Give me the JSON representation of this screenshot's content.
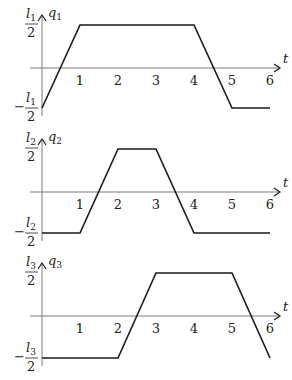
{
  "figure": {
    "t_axis_label": "t",
    "tick_labels": [
      "1",
      "2",
      "3",
      "4",
      "5",
      "6"
    ],
    "colors": {
      "curve": "#1a1a1a",
      "axis": "#7a7a7a",
      "text": "#222222"
    }
  },
  "plots": [
    {
      "id": "q1",
      "y_label": "q",
      "y_label_sub": "1",
      "top_label": "l",
      "top_label_sub": "1",
      "bottom_label": "l",
      "bottom_label_sub": "1",
      "denominator": "2",
      "minus": "−"
    },
    {
      "id": "q2",
      "y_label": "q",
      "y_label_sub": "2",
      "top_label": "l",
      "top_label_sub": "2",
      "bottom_label": "l",
      "bottom_label_sub": "2",
      "denominator": "2",
      "minus": "−"
    },
    {
      "id": "q3",
      "y_label": "q",
      "y_label_sub": "3",
      "top_label": "l",
      "top_label_sub": "3",
      "bottom_label": "l",
      "bottom_label_sub": "3",
      "denominator": "2",
      "minus": "−"
    }
  ],
  "chart_data": [
    {
      "type": "line",
      "title": "q1(t)",
      "xlabel": "t",
      "ylabel": "q1",
      "x": [
        0,
        1,
        4,
        5,
        6
      ],
      "y": [
        "-l1/2",
        "l1/2",
        "l1/2",
        "-l1/2",
        "-l1/2"
      ],
      "y_numeric": [
        -0.5,
        0.5,
        0.5,
        -0.5,
        -0.5
      ],
      "xlim": [
        0,
        6
      ],
      "ylim": [
        -0.5,
        0.5
      ],
      "x_ticks": [
        1,
        2,
        3,
        4,
        5,
        6
      ],
      "y_ticks": [
        "-l1/2",
        "l1/2"
      ],
      "grid": false
    },
    {
      "type": "line",
      "title": "q2(t)",
      "xlabel": "t",
      "ylabel": "q2",
      "x": [
        0,
        1,
        2,
        3,
        4,
        6
      ],
      "y": [
        "-l2/2",
        "-l2/2",
        "l2/2",
        "l2/2",
        "-l2/2",
        "-l2/2"
      ],
      "y_numeric": [
        -0.5,
        -0.5,
        0.5,
        0.5,
        -0.5,
        -0.5
      ],
      "xlim": [
        0,
        6
      ],
      "ylim": [
        -0.5,
        0.5
      ],
      "x_ticks": [
        1,
        2,
        3,
        4,
        5,
        6
      ],
      "y_ticks": [
        "-l2/2",
        "l2/2"
      ],
      "grid": false
    },
    {
      "type": "line",
      "title": "q3(t)",
      "xlabel": "t",
      "ylabel": "q3",
      "x": [
        0,
        2,
        3,
        5,
        6
      ],
      "y": [
        "-l3/2",
        "-l3/2",
        "l3/2",
        "l3/2",
        "-l3/2"
      ],
      "y_numeric": [
        -0.5,
        -0.5,
        0.5,
        0.5,
        -0.5
      ],
      "xlim": [
        0,
        6
      ],
      "ylim": [
        -0.5,
        0.5
      ],
      "x_ticks": [
        1,
        2,
        3,
        4,
        5,
        6
      ],
      "y_ticks": [
        "-l3/2",
        "l3/2"
      ],
      "grid": false
    }
  ]
}
